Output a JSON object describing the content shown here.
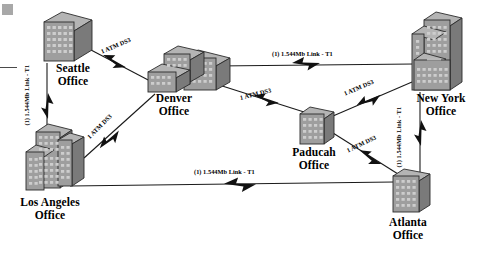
{
  "diagram": {
    "type": "network-topology",
    "background_color": "#ffffff",
    "building_face_color": "#9c9c9c",
    "building_side_color": "#767676",
    "building_top_color": "#b4b4b4",
    "building_outline_color": "#2b2b2b",
    "window_color": "#c8c8c8",
    "line_color": "#1a1a1a",
    "corner_mark_color": "#a8a8a8"
  },
  "sites": [
    {
      "id": "seattle",
      "label": "Seattle\nOffice",
      "label_x": 48,
      "label_y": 62,
      "building_style": "tower-single",
      "x": 44,
      "y": 14,
      "w": 48,
      "h": 46
    },
    {
      "id": "denver",
      "label": "Denver\nOffice",
      "label_x": 146,
      "label_y": 92,
      "building_style": "tower-double-wide",
      "x": 148,
      "y": 46,
      "w": 68,
      "h": 44
    },
    {
      "id": "new-york",
      "label": "New York\nOffice",
      "label_x": 412,
      "label_y": 92,
      "building_style": "tower-tall-step",
      "x": 414,
      "y": 12,
      "w": 48,
      "h": 74
    },
    {
      "id": "los-angeles",
      "label": "Los Angeles\nOffice",
      "label_x": 9,
      "label_y": 198,
      "building_style": "tower-triple",
      "x": 28,
      "y": 120,
      "w": 56,
      "h": 72
    },
    {
      "id": "paducah",
      "label": "Paducah\nOffice",
      "label_x": 289,
      "label_y": 148,
      "building_style": "block-medium",
      "x": 300,
      "y": 108,
      "w": 34,
      "h": 38
    },
    {
      "id": "atlanta",
      "label": "Atlanta\nOffice",
      "label_x": 381,
      "label_y": 218,
      "building_style": "block-medium",
      "x": 393,
      "y": 170,
      "w": 38,
      "h": 42
    }
  ],
  "links": [
    {
      "id": "seattle-los-angeles",
      "from": "seattle",
      "to": "los-angeles",
      "label": "(1) 1.544Mb Link - T1",
      "label_x": 33,
      "label_y": 128,
      "rotation": -90
    },
    {
      "id": "seattle-denver",
      "from": "seattle",
      "to": "denver",
      "label": "1 ATM DS3",
      "label_x": 104,
      "label_y": 54,
      "rotation": -22
    },
    {
      "id": "los-angeles-denver",
      "from": "los-angeles",
      "to": "denver",
      "label": "1 ATM DS3",
      "label_x": 93,
      "label_y": 136,
      "rotation": -43
    },
    {
      "id": "denver-new-york",
      "from": "denver",
      "to": "new-york",
      "label": "(1) 1.544Mb Link - T1",
      "label_x": 274,
      "label_y": 55,
      "rotation": 0
    },
    {
      "id": "denver-paducah",
      "from": "denver",
      "to": "paducah",
      "label": "1 ATM DS3",
      "label_x": 242,
      "label_y": 100,
      "rotation": -13
    },
    {
      "id": "paducah-new-york",
      "from": "paducah",
      "to": "new-york",
      "label": "1 ATM DS3",
      "label_x": 347,
      "label_y": 95,
      "rotation": -22
    },
    {
      "id": "paducah-atlanta",
      "from": "paducah",
      "to": "atlanta",
      "label": "1 ATM DS3",
      "label_x": 350,
      "label_y": 152,
      "rotation": -25
    },
    {
      "id": "new-york-atlanta",
      "from": "new-york",
      "to": "atlanta",
      "label": "(1) 1.544Mb Link - T1",
      "label_x": 404,
      "label_y": 170,
      "rotation": -90
    },
    {
      "id": "los-angeles-atlanta",
      "from": "los-angeles",
      "to": "atlanta",
      "label": "(1) 1.544Mb Link - T1",
      "label_x": 196,
      "label_y": 172,
      "rotation": 0
    }
  ]
}
